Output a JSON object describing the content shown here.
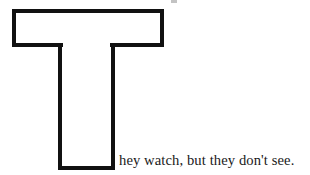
{
  "page": {
    "background_color": "#ffffff",
    "ink_color": "#111111",
    "text_color": "#1a1a1a",
    "width": 310,
    "height": 175
  },
  "dropcap": {
    "letter": "T",
    "style": "outlined",
    "icon_name": "letter-t-outline",
    "stroke_color": "#111111",
    "stroke_width": 4,
    "fill_color": "#ffffff",
    "bar": {
      "x": 12,
      "y": 9,
      "width": 152,
      "height": 38
    },
    "stem": {
      "x": 58,
      "y": 47,
      "width": 57,
      "height": 122
    }
  },
  "sentence": {
    "full": "They watch, but they don't see.",
    "remainder": "hey watch, but they don't see."
  },
  "artifacts": {
    "speck_label": "scan-speck"
  }
}
